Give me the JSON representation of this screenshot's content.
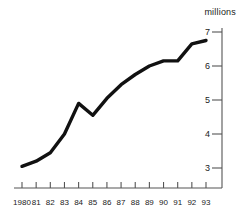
{
  "chart_data": {
    "type": "line",
    "title": "",
    "subtitle": "",
    "xlabel": "",
    "ylabel": "millions",
    "unit_label": "millions",
    "categories": [
      "1980",
      "81",
      "82",
      "83",
      "84",
      "85",
      "86",
      "87",
      "88",
      "89",
      "90",
      "91",
      "92",
      "93"
    ],
    "x": [
      1980,
      1981,
      1982,
      1983,
      1984,
      1985,
      1986,
      1987,
      1988,
      1989,
      1990,
      1991,
      1992,
      1993
    ],
    "values": [
      3.05,
      3.2,
      3.45,
      4.0,
      4.9,
      4.55,
      5.05,
      5.45,
      5.75,
      6.0,
      6.15,
      6.15,
      6.65,
      6.75
    ],
    "ylim": [
      2.6,
      7.2
    ],
    "xlim": [
      1979.6,
      1993.4
    ],
    "yticks": [
      3,
      4,
      5,
      6,
      7
    ],
    "ytick_labels": [
      "3",
      "4",
      "5",
      "6",
      "7"
    ],
    "grid": false,
    "legend": "none",
    "axis_position": "right",
    "line_color": "#111111",
    "line_width": 3.4,
    "axis_color": "#555555",
    "background_color": "#ffffff"
  },
  "colors": {
    "line": "#111111",
    "axis": "#555555",
    "text": "#222222",
    "background": "#ffffff"
  }
}
